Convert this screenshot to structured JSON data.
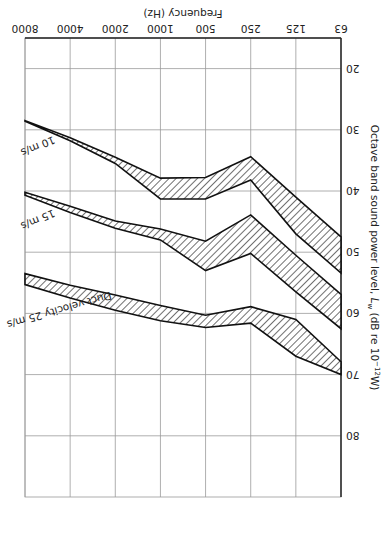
{
  "figure": {
    "rotation_deg": 180,
    "note": "Figure printed upside down"
  },
  "chart_data": {
    "type": "area",
    "title": "",
    "xlabel": "Frequency (Hz)",
    "ylabel": "Octave band sound power level, Lw (dB re 10^-12 W)",
    "ylabel_main": "Octave band sound power level, ",
    "ylabel_symbol": "L",
    "ylabel_sub": "w",
    "ylabel_unit": " (dB re 10",
    "ylabel_exp": "−12",
    "ylabel_end": "W)",
    "categories": [
      "63",
      "125",
      "250",
      "500",
      "1000",
      "2000",
      "4000",
      "8000"
    ],
    "y_ticks": [
      "20",
      "30",
      "40",
      "50",
      "60",
      "70",
      "80"
    ],
    "ylim": [
      15,
      90
    ],
    "grid": true,
    "series": [
      {
        "name": "10 m/s",
        "label": "10 m/s",
        "lower": [
          47.5,
          41.0,
          34.4,
          37.8,
          37.9,
          34.5,
          31.3,
          28.5
        ],
        "upper": [
          53.4,
          47.0,
          38.2,
          41.3,
          41.3,
          35.5,
          31.8,
          28.6
        ]
      },
      {
        "name": "15 m/s",
        "label": "15 m/s",
        "lower": [
          56.9,
          50.5,
          43.9,
          48.2,
          46.2,
          44.9,
          42.5,
          40.2
        ],
        "upper": [
          62.5,
          56.5,
          50.2,
          53.0,
          48.0,
          46.1,
          43.5,
          40.7
        ]
      },
      {
        "name": "25 m/s",
        "label": "Duct velocity 25 m/s",
        "lower": [
          67.9,
          61.0,
          58.9,
          60.3,
          58.7,
          57.0,
          55.4,
          53.5
        ],
        "upper": [
          70.0,
          67.0,
          61.6,
          62.3,
          61.2,
          59.5,
          57.5,
          55.3
        ]
      }
    ]
  }
}
